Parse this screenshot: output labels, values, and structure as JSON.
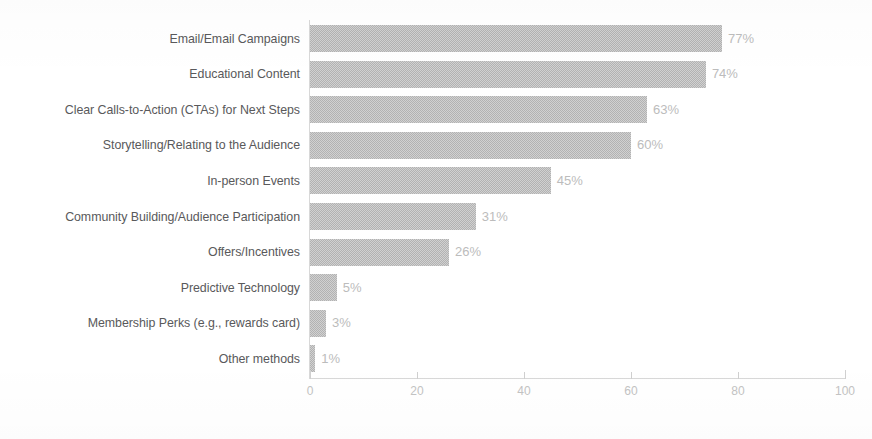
{
  "chart_data": {
    "type": "bar",
    "orientation": "horizontal",
    "title": "",
    "subtitle": "",
    "xlabel": "",
    "ylabel": "",
    "xlim": [
      0,
      100
    ],
    "xticks": [
      0,
      20,
      40,
      60,
      80,
      100
    ],
    "xtick_labels": [
      "0",
      "20",
      "40",
      "60",
      "80",
      "100"
    ],
    "grid": false,
    "legend": false,
    "value_suffix": "%",
    "bar_color": "#b2b2b2",
    "value_label_color": "#bcbcbc",
    "category_label_color": "#59595b",
    "axis_color": "#d8d8d8",
    "background_color": "#ffffff",
    "categories": [
      "Email/Email Campaigns",
      "Educational Content",
      "Clear Calls-to-Action (CTAs) for Next Steps",
      "Storytelling/Relating to the Audience",
      "In-person Events",
      "Community Building/Audience Participation",
      "Offers/Incentives",
      "Predictive Technology",
      "Membership Perks (e.g., rewards card)",
      "Other methods"
    ],
    "values": [
      77,
      74,
      63,
      60,
      45,
      31,
      26,
      5,
      3,
      1
    ],
    "data_labels": [
      "77%",
      "74%",
      "63%",
      "60%",
      "45%",
      "31%",
      "26%",
      "5%",
      "3%",
      "1%"
    ]
  }
}
